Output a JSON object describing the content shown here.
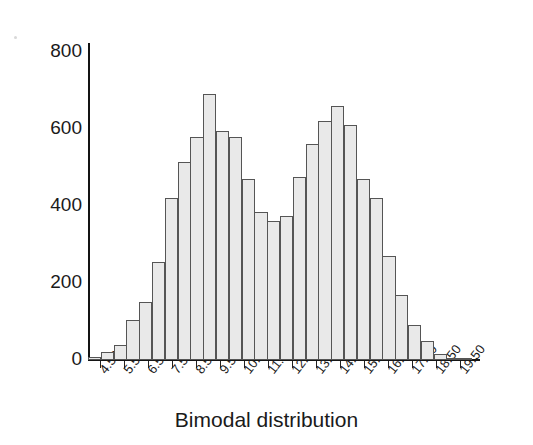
{
  "chart_data": {
    "type": "bar",
    "title": "Bimodal distribution",
    "xlabel": "Bimodal distribution",
    "ylabel": "",
    "grid": false,
    "legend": null,
    "legend_position": "none",
    "xlim": [
      4.0,
      20.0
    ],
    "ylim": [
      0,
      800
    ],
    "ytick_labels": [
      "800",
      "600",
      "400",
      "200",
      "0"
    ],
    "ytick_values": [
      800,
      600,
      400,
      200,
      0
    ],
    "xtick_labels": [
      "4.50",
      "5.50",
      "6.50",
      "7.50",
      "8.50",
      "9.50",
      "10.50",
      "11.50",
      "12.50",
      "13.50",
      "14.50",
      "15.50",
      "16.50",
      "17.50",
      "18.50",
      "19.50"
    ],
    "xtick_values": [
      4.5,
      5.5,
      6.5,
      7.5,
      8.5,
      9.5,
      10.5,
      11.5,
      12.5,
      13.5,
      14.5,
      15.5,
      16.5,
      17.5,
      18.5,
      19.5
    ],
    "bin_width": 0.5,
    "categories": [
      4.25,
      4.75,
      5.25,
      5.75,
      6.25,
      6.75,
      7.25,
      7.75,
      8.25,
      8.75,
      9.25,
      9.75,
      10.25,
      10.75,
      11.25,
      11.75,
      12.25,
      12.75,
      13.25,
      13.75,
      14.25,
      14.75,
      15.25,
      15.75,
      16.25,
      16.75,
      17.25,
      17.75,
      18.25,
      18.75
    ],
    "values": [
      8,
      20,
      38,
      105,
      150,
      255,
      420,
      515,
      580,
      690,
      595,
      580,
      470,
      385,
      360,
      375,
      475,
      560,
      620,
      660,
      610,
      470,
      420,
      270,
      170,
      90,
      50,
      15,
      6,
      4
    ],
    "bar_fill_color": "#e9e9e9",
    "bar_edge_color": "#555555",
    "axis_color": "#141414",
    "background_color": "#ffffff"
  },
  "axes": {
    "y_ticks": [
      {
        "label": "800",
        "value": 800
      },
      {
        "label": "600",
        "value": 600
      },
      {
        "label": "400",
        "value": 400
      },
      {
        "label": "200",
        "value": 200
      },
      {
        "label": "0",
        "value": 0
      }
    ],
    "x_ticks": [
      {
        "label": "4.50",
        "value": 4.5
      },
      {
        "label": "5.50",
        "value": 5.5
      },
      {
        "label": "6.50",
        "value": 6.5
      },
      {
        "label": "7.50",
        "value": 7.5
      },
      {
        "label": "8.50",
        "value": 8.5
      },
      {
        "label": "9.50",
        "value": 9.5
      },
      {
        "label": "10.50",
        "value": 10.5
      },
      {
        "label": "11.50",
        "value": 11.5
      },
      {
        "label": "12.50",
        "value": 12.5
      },
      {
        "label": "13.50",
        "value": 13.5
      },
      {
        "label": "14.50",
        "value": 14.5
      },
      {
        "label": "15.50",
        "value": 15.5
      },
      {
        "label": "16.50",
        "value": 16.5
      },
      {
        "label": "17.50",
        "value": 17.5
      },
      {
        "label": "18.50",
        "value": 18.5
      },
      {
        "label": "19.50",
        "value": 19.5
      }
    ]
  },
  "title": {
    "text": "Bimodal distribution"
  }
}
